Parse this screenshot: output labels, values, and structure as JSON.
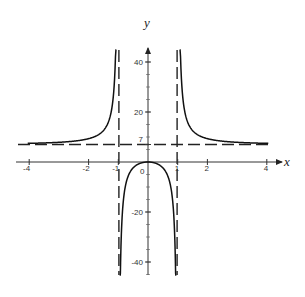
{
  "chart_data": {
    "type": "line",
    "title": "",
    "xlabel": "x",
    "ylabel": "y",
    "xlim": [
      -4.2,
      4.3
    ],
    "ylim": [
      -50,
      45
    ],
    "grid": false,
    "legend": null,
    "x_ticks": [
      {
        "value": -4,
        "label": "-4"
      },
      {
        "value": -2,
        "label": "-2"
      },
      {
        "value": -1,
        "label": "-1"
      },
      {
        "value": 0,
        "label": "0"
      },
      {
        "value": 1,
        "label": "1"
      },
      {
        "value": 2,
        "label": "2"
      },
      {
        "value": 4,
        "label": "4"
      }
    ],
    "y_ticks": [
      {
        "value": 40,
        "label": "40"
      },
      {
        "value": 20,
        "label": "20"
      },
      {
        "value": 7,
        "label": "7"
      },
      {
        "value": -20,
        "label": "-20"
      },
      {
        "value": -40,
        "label": "-40"
      }
    ],
    "asymptotes": {
      "vertical": [
        -1,
        1
      ],
      "horizontal": [
        7
      ]
    },
    "function": "y = 7x^2/(x^2-1)",
    "series": [
      {
        "name": "left branch",
        "x": [
          -4,
          -3,
          -2,
          -1.5,
          -1.3,
          -1.2,
          -1.15,
          -1.1,
          -1.07
        ],
        "y": [
          7.47,
          7.88,
          9.33,
          12.6,
          17.2,
          22.9,
          28.6,
          40.3,
          51.5
        ]
      },
      {
        "name": "middle branch",
        "x": [
          -0.95,
          -0.9,
          -0.8,
          -0.6,
          -0.4,
          -0.2,
          0,
          0.2,
          0.4,
          0.6,
          0.8,
          0.9,
          0.95
        ],
        "y": [
          -64.8,
          -33.2,
          -12.4,
          -3.94,
          -1.33,
          -0.29,
          0,
          -0.29,
          -1.33,
          -3.94,
          -12.4,
          -33.2,
          -64.8
        ]
      },
      {
        "name": "right branch",
        "x": [
          1.07,
          1.1,
          1.15,
          1.2,
          1.3,
          1.5,
          2,
          3,
          4
        ],
        "y": [
          51.5,
          40.3,
          28.6,
          22.9,
          17.2,
          12.6,
          9.33,
          7.88,
          7.47
        ]
      }
    ]
  },
  "labels": {
    "x_axis": "x",
    "y_axis": "y"
  }
}
